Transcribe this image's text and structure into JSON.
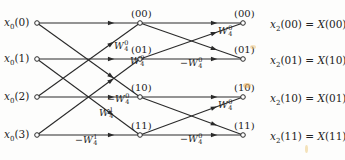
{
  "diagram": {
    "inputs": [
      {
        "id": "x0_0",
        "base": "x",
        "sub": "0",
        "arg": "(0)",
        "y": 23
      },
      {
        "id": "x0_1",
        "base": "x",
        "sub": "0",
        "arg": "(1)",
        "y": 59
      },
      {
        "id": "x0_2",
        "base": "x",
        "sub": "0",
        "arg": "(2)",
        "y": 97
      },
      {
        "id": "x0_3",
        "base": "x",
        "sub": "0",
        "arg": "(3)",
        "y": 135
      }
    ],
    "middle_nodes": [
      {
        "id": "m00",
        "label": "(00)",
        "y": 23
      },
      {
        "id": "m01",
        "label": "(01)",
        "y": 59
      },
      {
        "id": "m10",
        "label": "(10)",
        "y": 97
      },
      {
        "id": "m11",
        "label": "(11)",
        "y": 135
      }
    ],
    "output_nodes": [
      {
        "id": "o00",
        "label": "(00)",
        "y": 23
      },
      {
        "id": "o01",
        "label": "(01)",
        "y": 59
      },
      {
        "id": "o10",
        "label": "(10)",
        "y": 97
      },
      {
        "id": "o11",
        "label": "(11)",
        "y": 135
      }
    ],
    "results": [
      {
        "lhs_base": "x",
        "lhs_sub": "2",
        "lhs_arg": "(00)",
        "eq": " = ",
        "rhs_base": "X",
        "rhs_arg": "(00)"
      },
      {
        "lhs_base": "x",
        "lhs_sub": "2",
        "lhs_arg": "(01)",
        "eq": " = ",
        "rhs_base": "X",
        "rhs_arg": "(10)"
      },
      {
        "lhs_base": "x",
        "lhs_sub": "2",
        "lhs_arg": "(10)",
        "eq": " = ",
        "rhs_base": "X",
        "rhs_arg": "(01)"
      },
      {
        "lhs_base": "x",
        "lhs_sub": "2",
        "lhs_arg": "(11)",
        "eq": " = ",
        "rhs_base": "X",
        "rhs_arg": "(11)"
      }
    ],
    "weights": [
      {
        "id": "w_s1_a",
        "sign": "",
        "base": "W",
        "sup": "0",
        "sub": "4",
        "x": 114,
        "y": 47
      },
      {
        "id": "w_s1_b",
        "sign": "",
        "base": "W",
        "sup": "0",
        "sub": "4",
        "x": 130,
        "y": 62
      },
      {
        "id": "w_s1_c",
        "sign": "−",
        "base": "W",
        "sup": "0",
        "sub": "4",
        "x": 107,
        "y": 100
      },
      {
        "id": "w_s1_d",
        "sign": "",
        "base": "W",
        "sup": "1",
        "sub": "4",
        "x": 99,
        "y": 114
      },
      {
        "id": "w_s1_e",
        "sign": "−",
        "base": "W",
        "sup": "1",
        "sub": "4",
        "x": 75,
        "y": 141
      },
      {
        "id": "w_s2_a",
        "sign": "",
        "base": "W",
        "sup": "0",
        "sub": "4",
        "x": 218,
        "y": 32
      },
      {
        "id": "w_s2_b",
        "sign": "−",
        "base": "W",
        "sup": "0",
        "sub": "4",
        "x": 180,
        "y": 64
      },
      {
        "id": "w_s2_c",
        "sign": "",
        "base": "W",
        "sup": "0",
        "sub": "4",
        "x": 218,
        "y": 106
      },
      {
        "id": "w_s2_d",
        "sign": "−",
        "base": "W",
        "sup": "0",
        "sub": "4",
        "x": 180,
        "y": 140
      }
    ],
    "colors": {
      "line": "#2a2a2a",
      "background": "#fdfdfc",
      "stain": "#e8b45a"
    }
  }
}
